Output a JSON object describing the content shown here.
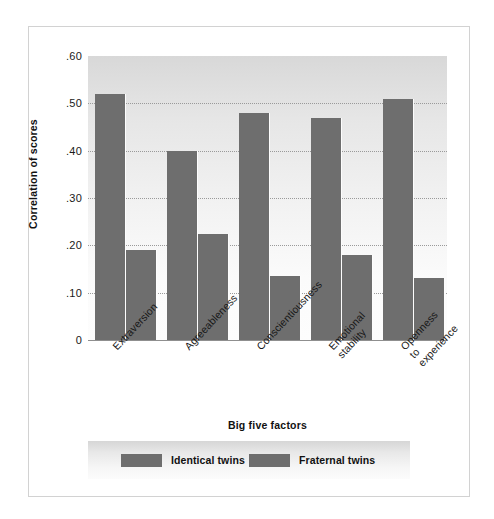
{
  "chart_data": {
    "type": "bar",
    "title": "",
    "xlabel": "Big five factors",
    "ylabel": "Correlation of scores",
    "ylim": [
      0,
      0.6
    ],
    "ytick_labels": [
      ".60",
      ".50",
      ".40",
      ".30",
      ".20",
      ".10",
      "0"
    ],
    "ytick_values": [
      0.6,
      0.5,
      0.4,
      0.3,
      0.2,
      0.1,
      0
    ],
    "grid": true,
    "grid_axis": "y",
    "grid_style": "dotted",
    "legend_position": "bottom",
    "categories": [
      "Extraversion",
      "Agreeableness",
      "Conscientiousness",
      "Emotional\nstability",
      "Openness\nto\nexperience"
    ],
    "series": [
      {
        "name": "Identical twins",
        "color": "#6e6e6e",
        "values": [
          0.52,
          0.4,
          0.48,
          0.47,
          0.51
        ]
      },
      {
        "name": "Fraternal twins",
        "color": "#6e6e6e",
        "values": [
          0.19,
          0.225,
          0.135,
          0.18,
          0.13
        ]
      }
    ]
  },
  "colors": {
    "bar": "#6e6e6e",
    "gridline": "#9a9a9a",
    "frame_border": "#d2d2d2",
    "axis_line": "#8f8f8f",
    "text": "#111111"
  }
}
